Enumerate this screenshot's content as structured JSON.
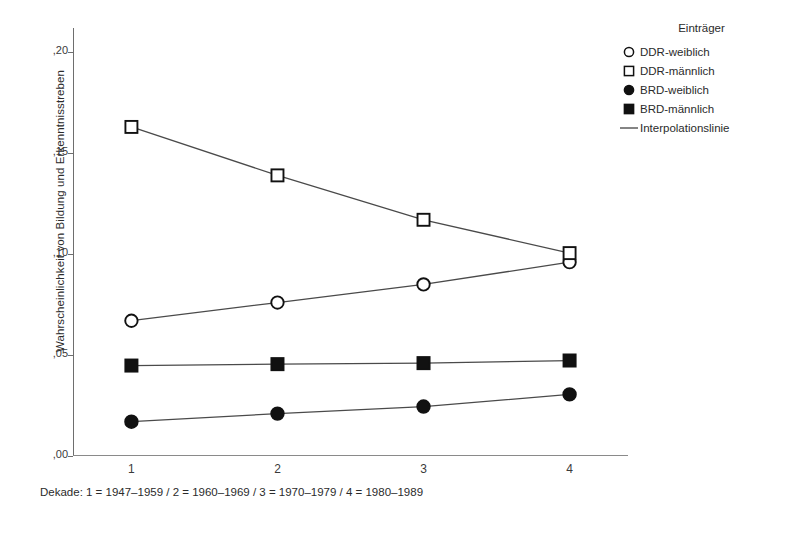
{
  "chart_data": {
    "type": "line",
    "title": "",
    "xlabel": "Dekade: 1 = 1947–1959 / 2 = 1960–1969 / 3 = 1970–1979 / 4 = 1980–1989",
    "ylabel": "Wahrscheinlichkeit von Bildung und Erkenntnisstreben",
    "categories": [
      "1",
      "2",
      "3",
      "4"
    ],
    "x": [
      1,
      2,
      3,
      4
    ],
    "xlim": [
      0.6,
      4.4
    ],
    "ylim": [
      0.0,
      0.212
    ],
    "grid": false,
    "legend_position": "right",
    "ytick_labels": [
      ",00",
      ",05",
      ",10",
      ",15",
      ",20"
    ],
    "ytick_values": [
      0.0,
      0.05,
      0.1,
      0.15,
      0.2
    ],
    "xtick_labels": [
      "1",
      "2",
      "3",
      "4"
    ],
    "series": [
      {
        "name": "DDR-weiblich",
        "marker": "open-circle",
        "values": [
          0.067,
          0.076,
          0.085,
          0.096
        ]
      },
      {
        "name": "DDR-männlich",
        "marker": "open-square",
        "values": [
          0.163,
          0.139,
          0.117,
          0.1005
        ]
      },
      {
        "name": "BRD-weiblich",
        "marker": "filled-circle",
        "values": [
          0.017,
          0.021,
          0.0245,
          0.0305
        ]
      },
      {
        "name": "BRD-männlich",
        "marker": "filled-square",
        "values": [
          0.0448,
          0.0455,
          0.046,
          0.0473
        ]
      }
    ],
    "line_color": "#4a4a4a",
    "marker_color": "#111111"
  },
  "legend": {
    "title": "Einträger",
    "items": [
      {
        "label": "DDR-weiblich",
        "marker": "open-circle"
      },
      {
        "label": "DDR-männlich",
        "marker": "open-square"
      },
      {
        "label": "BRD-weiblich",
        "marker": "filled-circle"
      },
      {
        "label": "BRD-männlich",
        "marker": "filled-square"
      },
      {
        "label": "Interpolationslinie",
        "marker": "line"
      }
    ]
  },
  "axes": {
    "y_title": "Wahrscheinlichkeit von Bildung und Erkenntnisstreben",
    "x_caption": "Dekade: 1 = 1947–1959 / 2 = 1960–1969 / 3 = 1970–1979 / 4 = 1980–1989",
    "y_ticks": [
      {
        "label": ",00",
        "value": 0.0
      },
      {
        "label": ",05",
        "value": 0.05
      },
      {
        "label": ",10",
        "value": 0.1
      },
      {
        "label": ",15",
        "value": 0.15
      },
      {
        "label": ",20",
        "value": 0.2
      }
    ],
    "x_ticks": [
      {
        "label": "1",
        "value": 1
      },
      {
        "label": "2",
        "value": 2
      },
      {
        "label": "3",
        "value": 3
      },
      {
        "label": "4",
        "value": 4
      }
    ]
  }
}
